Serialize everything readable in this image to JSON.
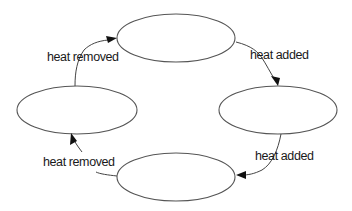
{
  "diagram": {
    "type": "cycle",
    "nodes": [
      {
        "id": "top",
        "label": ""
      },
      {
        "id": "right",
        "label": ""
      },
      {
        "id": "bottom",
        "label": ""
      },
      {
        "id": "left",
        "label": ""
      }
    ],
    "edges": [
      {
        "from": "top",
        "to": "right",
        "label": "heat added"
      },
      {
        "from": "right",
        "to": "bottom",
        "label": "heat added"
      },
      {
        "from": "bottom",
        "to": "left",
        "label": "heat removed"
      },
      {
        "from": "left",
        "to": "top",
        "label": "heat removed"
      }
    ]
  },
  "colors": {
    "stroke": "#555555",
    "arrow": "#111111",
    "text": "#1a1a1a",
    "background": "#ffffff"
  }
}
